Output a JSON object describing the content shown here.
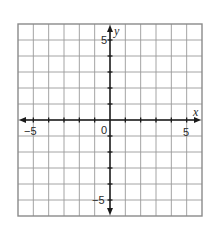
{
  "chart_data": {
    "type": "scatter",
    "title": "",
    "xlabel": "x",
    "ylabel": "y",
    "xlim": [
      -6,
      6
    ],
    "ylim": [
      -6,
      6
    ],
    "grid": true,
    "grid_step": 1,
    "x_tick_labels": [
      {
        "value": -5,
        "label": "−5"
      },
      {
        "value": 0,
        "label": "0"
      },
      {
        "value": 5,
        "label": "5"
      }
    ],
    "y_tick_labels": [
      {
        "value": 5,
        "label": "5"
      },
      {
        "value": -5,
        "label": "−5"
      }
    ],
    "series": [],
    "legend": null
  },
  "labels": {
    "x_axis": "x",
    "y_axis": "y",
    "origin": "0",
    "x_neg5": "−5",
    "x_pos5": "5",
    "y_pos5": "5",
    "y_neg5": "−5"
  },
  "colors": {
    "grid": "#9a9a9a",
    "border": "#8a8a8a",
    "axis": "#1a1a1a",
    "background": "#ffffff"
  }
}
